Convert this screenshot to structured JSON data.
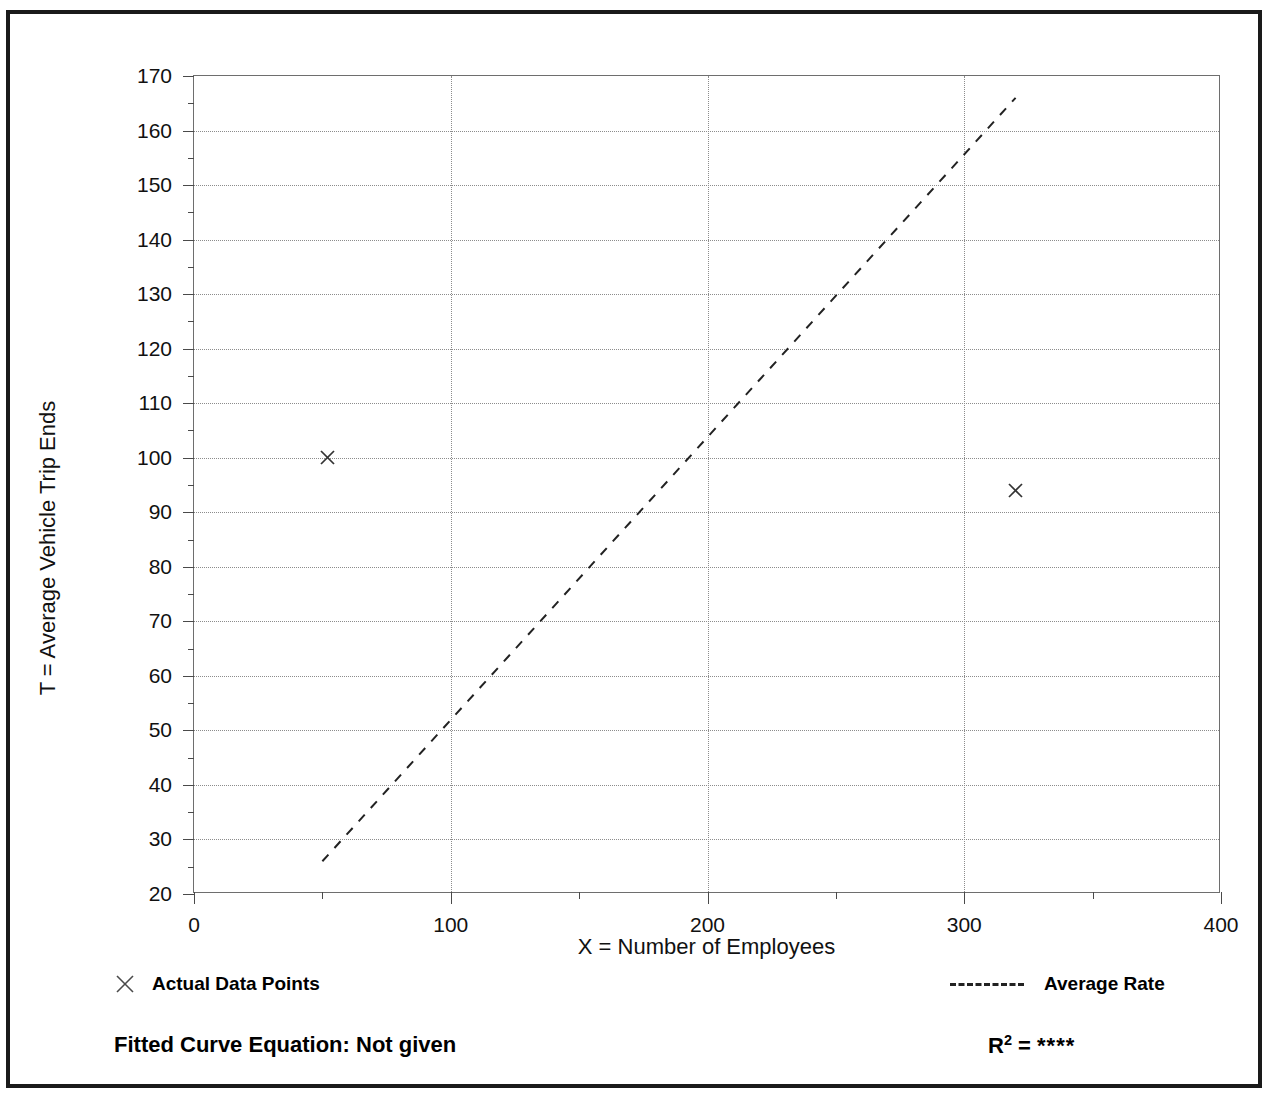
{
  "title": "",
  "chart_data": {
    "type": "scatter",
    "title": "",
    "xlabel": "X = Number of Employees",
    "ylabel": "T = Average Vehicle Trip Ends",
    "xlim": [
      0,
      400
    ],
    "ylim": [
      20,
      170
    ],
    "x_ticks": [
      0,
      100,
      200,
      300,
      400
    ],
    "x_tick_labels": [
      "0",
      "100",
      "200",
      "300",
      "400"
    ],
    "x_minor_step": 50,
    "y_ticks": [
      20,
      30,
      40,
      50,
      60,
      70,
      80,
      90,
      100,
      110,
      120,
      130,
      140,
      150,
      160,
      170
    ],
    "y_tick_labels": [
      "20",
      "30",
      "40",
      "50",
      "60",
      "70",
      "80",
      "90",
      "100",
      "110",
      "120",
      "130",
      "140",
      "150",
      "160",
      "170"
    ],
    "y_minor_step": 5,
    "grid": "dotted",
    "legend_position": "below-plot",
    "series": [
      {
        "name": "Actual Data Points",
        "type": "scatter",
        "marker": "x",
        "color": "#333333",
        "points": [
          {
            "x": 52,
            "y": 100
          },
          {
            "x": 320,
            "y": 94
          }
        ]
      },
      {
        "name": "Average Rate",
        "type": "line",
        "style": "dashed",
        "color": "#222222",
        "points": [
          {
            "x": 50,
            "y": 26
          },
          {
            "x": 320,
            "y": 166
          }
        ]
      }
    ]
  },
  "legend": {
    "entries": [
      {
        "label": "Actual Data Points",
        "marker": "x"
      },
      {
        "label": "Average Rate",
        "marker": "dashed-line"
      }
    ]
  },
  "annotations": {
    "equation_label": "Fitted Curve Equation:  Not given",
    "r2_prefix": "R",
    "r2_exponent": "2",
    "r2_equals": " = ",
    "r2_value": "****"
  },
  "colors": {
    "frame": "#1a1a1a",
    "axis": "#6e6e6e",
    "grid": "#8c8c8c",
    "marker": "#333333",
    "trend": "#222222",
    "text": "#000000",
    "background": "#ffffff"
  }
}
